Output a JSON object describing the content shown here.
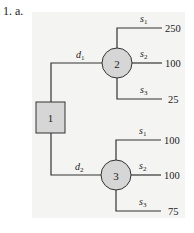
{
  "problem_label": "1. a.",
  "colors": {
    "panel": "#f4f4f2",
    "node_fill": "#d6d6d6",
    "line": "#333333"
  },
  "decision_node": {
    "label": "1",
    "shape": "square"
  },
  "decisions": [
    {
      "label": "d",
      "sub": "1",
      "chance_node": {
        "label": "2",
        "shape": "circle"
      },
      "branches": [
        {
          "label": "s",
          "sub": "1",
          "payoff": "250"
        },
        {
          "label": "s",
          "sub": "2",
          "payoff": "100"
        },
        {
          "label": "s",
          "sub": "3",
          "payoff": "25"
        }
      ]
    },
    {
      "label": "d",
      "sub": "2",
      "chance_node": {
        "label": "3",
        "shape": "circle"
      },
      "branches": [
        {
          "label": "s",
          "sub": "1",
          "payoff": "100"
        },
        {
          "label": "s",
          "sub": "2",
          "payoff": "100"
        },
        {
          "label": "s",
          "sub": "3",
          "payoff": "75"
        }
      ]
    }
  ]
}
